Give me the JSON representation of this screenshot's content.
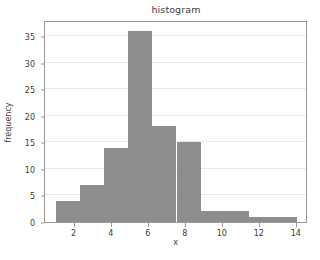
{
  "chart_data": {
    "type": "bar",
    "title": "histogram",
    "xlabel": "x",
    "ylabel": "frequency",
    "xlim": [
      0.4,
      14.6
    ],
    "ylim": [
      0,
      38
    ],
    "grid": true,
    "grid_axis": "y",
    "legend": false,
    "bar_color": "#8d8d8d",
    "bin_edges": [
      1.0,
      2.3,
      3.6,
      4.9,
      6.2,
      7.5,
      8.8,
      10.1,
      11.4,
      12.7,
      14.0
    ],
    "categories": [
      "1.0-2.3",
      "2.3-3.6",
      "3.6-4.9",
      "4.9-6.2",
      "6.2-7.5",
      "7.5-8.8",
      "8.8-10.1",
      "10.1-11.4",
      "11.4-12.7",
      "12.7-14.0"
    ],
    "values": [
      4,
      7,
      14,
      36,
      18,
      15,
      2,
      2,
      1,
      1
    ],
    "xticks": [
      2,
      4,
      6,
      8,
      10,
      12,
      14
    ],
    "xtick_labels": [
      "2",
      "4",
      "6",
      "8",
      "10",
      "12",
      "14"
    ],
    "yticks": [
      0,
      5,
      10,
      15,
      20,
      25,
      30,
      35
    ],
    "ytick_labels": [
      "0",
      "5",
      "10",
      "15",
      "20",
      "25",
      "30",
      "35"
    ]
  },
  "figure": {
    "background_color": "#ffffff",
    "axes_edge_color": "#9a9a9a",
    "grid_color": "#e9e9e9",
    "text_color": "#3b3b3b"
  }
}
